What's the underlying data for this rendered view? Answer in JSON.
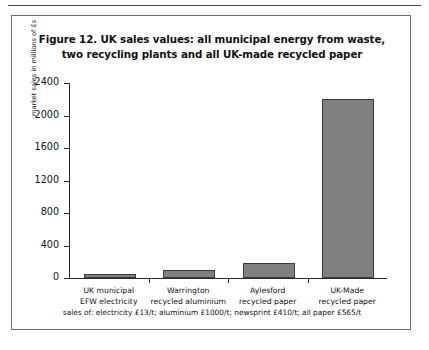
{
  "figure": {
    "title_line1": "Figure 12. UK sales values: all municipal energy from waste,",
    "title_line2": "two recycling plants and all UK-made recycled paper",
    "footnote": "sales of: electricity £13/t; aluminium £1000/t; newsprint £410/t; all paper £565/t"
  },
  "chart_data": {
    "type": "bar",
    "title": "Figure 12. UK sales values: all municipal energy from waste, two recycling plants and all UK-made recycled paper",
    "xlabel": "",
    "ylabel": "market sales in millions of £s",
    "ylim": [
      0,
      2400
    ],
    "yticks": [
      0,
      400,
      800,
      1200,
      1600,
      2000,
      2400
    ],
    "ytick_labels": [
      "0",
      "400",
      "800",
      "1200",
      "1600",
      "2000",
      "2400"
    ],
    "grid": false,
    "legend": "none",
    "bar_color": "#808080",
    "bar_edge_color": "#3a3a3a",
    "categories": [
      "UK municipal EFW electricity",
      "Warrington recycled aluminium",
      "Aylesford recycled paper",
      "UK-Made recycled paper"
    ],
    "category_lines": [
      [
        "UK municipal",
        "EFW electricity"
      ],
      [
        "Warrington",
        "recycled aluminium"
      ],
      [
        "Aylesford",
        "recycled paper"
      ],
      [
        "UK-Made",
        "recycled paper"
      ]
    ],
    "values": [
      45,
      100,
      185,
      2200
    ],
    "annotations": [
      "sales of: electricity £13/t; aluminium £1000/t; newsprint £410/t; all paper £565/t"
    ]
  }
}
